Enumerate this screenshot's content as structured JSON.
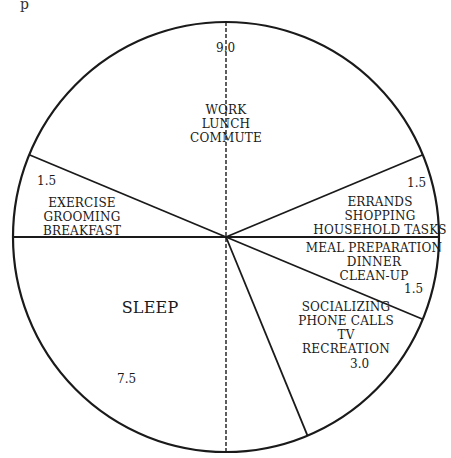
{
  "chart_data": {
    "type": "pie",
    "title": "",
    "unit": "hours",
    "total": 24,
    "start": "top (12 o'clock)",
    "direction": "clockwise",
    "slices": [
      {
        "label": "WORK LUNCH COMMUTE",
        "lines": [
          "WORK",
          "LUNCH",
          "COMMUTE"
        ],
        "value": 9.0,
        "value_label": "9.0"
      },
      {
        "label": "ERRANDS SHOPPING HOUSEHOLD TASKS",
        "lines": [
          "ERRANDS",
          "SHOPPING",
          "HOUSEHOLD TASKS"
        ],
        "value": 1.5,
        "value_label": "1.5"
      },
      {
        "label": "MEAL PREPARATION DINNER CLEAN-UP",
        "lines": [
          "MEAL PREPARATION",
          "DINNER",
          "CLEAN-UP"
        ],
        "value": 1.5,
        "value_label": "1.5"
      },
      {
        "label": "SOCIALIZING PHONE CALLS TV RECREATION",
        "lines": [
          "SOCIALIZING",
          "PHONE CALLS",
          "TV",
          "RECREATION"
        ],
        "value": 3.0,
        "value_label": "3.0"
      },
      {
        "label": "SLEEP",
        "lines": [
          "SLEEP"
        ],
        "value": 7.5,
        "value_label": "7.5"
      },
      {
        "label": "EXERCISE GROOMING BREAKFAST",
        "lines": [
          "EXERCISE",
          "GROOMING",
          "BREAKFAST"
        ],
        "value": 1.5,
        "value_label": "1.5"
      }
    ],
    "annotations": [
      "dashed vertical line through center (top to bottom)"
    ],
    "fill": "none (outline only)",
    "line_color": "#1a1a1a"
  },
  "fragment_text": "p"
}
